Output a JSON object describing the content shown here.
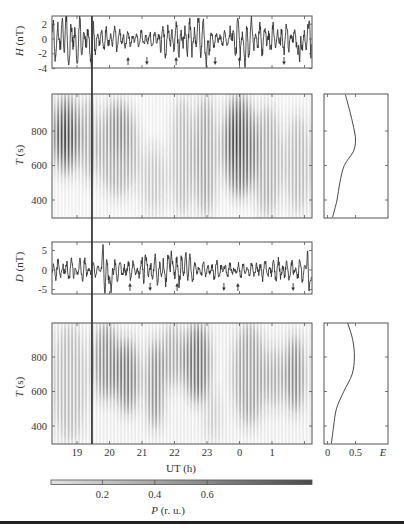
{
  "figure": {
    "marker": {
      "ut": 19.46
    }
  },
  "chart_data": [
    {
      "id": "H-waveform",
      "type": "line",
      "ylabel_var": "H",
      "ylabel_unit": " (nT)",
      "ytick_labels": [
        "2",
        "0",
        "-2",
        "-4"
      ],
      "yticks": [
        2,
        0,
        -2,
        -4
      ],
      "ylim": [
        -4,
        3
      ],
      "xlim": [
        18.23,
        26.2
      ],
      "envelope_nT": [
        [
          18.2,
          18.6,
          2.6
        ],
        [
          18.6,
          19.2,
          3.0
        ],
        [
          19.2,
          19.6,
          2.4
        ],
        [
          19.6,
          20.5,
          1.6
        ],
        [
          20.5,
          21.5,
          1.1
        ],
        [
          21.5,
          22.4,
          2.2
        ],
        [
          22.4,
          23.1,
          2.8
        ],
        [
          23.1,
          23.7,
          1.0
        ],
        [
          23.7,
          24.4,
          2.8
        ],
        [
          24.4,
          25.2,
          2.0
        ],
        [
          25.2,
          26.3,
          2.2
        ]
      ],
      "spikes": [
        [
          18.55,
          3.0
        ],
        [
          18.75,
          -3.5
        ],
        [
          19.0,
          -3.4
        ],
        [
          19.45,
          -4.3
        ],
        [
          22.75,
          3.0
        ],
        [
          22.98,
          -4.0
        ],
        [
          23.95,
          2.8
        ],
        [
          24.17,
          -4.2
        ],
        [
          25.85,
          -3.6
        ],
        [
          26.15,
          2.8
        ]
      ],
      "arrows": [
        {
          "ut": 20.57,
          "dir": "up"
        },
        {
          "ut": 21.15,
          "dir": "down"
        },
        {
          "ut": 22.05,
          "dir": "up"
        },
        {
          "ut": 23.25,
          "dir": "down"
        },
        {
          "ut": 24.0,
          "dir": "up"
        },
        {
          "ut": 25.37,
          "dir": "down"
        }
      ]
    },
    {
      "id": "H-spectrogram",
      "type": "heatmap",
      "ylabel_var": "T",
      "ylabel_unit": " (s)",
      "ytick_labels": [
        "800",
        "600",
        "400"
      ],
      "yticks": [
        800,
        600,
        400
      ],
      "ylim": [
        300,
        1000
      ],
      "xlim": [
        18.23,
        26.2
      ],
      "background_P": 0.06,
      "blobs_ut1_ut2_T1_T2_P": [
        [
          18.25,
          19.1,
          550,
          1010,
          0.6
        ],
        [
          18.35,
          18.9,
          650,
          900,
          0.7
        ],
        [
          19.1,
          19.6,
          500,
          1010,
          0.35
        ],
        [
          19.6,
          20.9,
          420,
          980,
          0.35
        ],
        [
          20.0,
          20.6,
          650,
          950,
          0.3
        ],
        [
          20.9,
          21.8,
          320,
          720,
          0.22
        ],
        [
          21.9,
          22.6,
          300,
          1010,
          0.3
        ],
        [
          22.6,
          23.3,
          300,
          1010,
          0.4
        ],
        [
          23.5,
          24.5,
          420,
          1010,
          0.65
        ],
        [
          23.7,
          24.1,
          600,
          900,
          0.7
        ],
        [
          24.4,
          25.3,
          300,
          950,
          0.35
        ],
        [
          25.4,
          26.2,
          320,
          900,
          0.3
        ]
      ]
    },
    {
      "id": "H-energy",
      "type": "line",
      "xlabel": "E",
      "xticks": [
        0,
        0.5
      ],
      "ylim": [
        300,
        1000
      ],
      "points_T_E": [
        [
          1010,
          0.32
        ],
        [
          900,
          0.41
        ],
        [
          800,
          0.48
        ],
        [
          740,
          0.5
        ],
        [
          680,
          0.46
        ],
        [
          600,
          0.3
        ],
        [
          500,
          0.22
        ],
        [
          400,
          0.17
        ],
        [
          300,
          0.09
        ]
      ]
    },
    {
      "id": "D-waveform",
      "type": "line",
      "ylabel_var": "D",
      "ylabel_unit": " (nT)",
      "ytick_labels": [
        "5",
        "0",
        "-5"
      ],
      "yticks": [
        5,
        0,
        -5
      ],
      "ylim": [
        -6,
        7
      ],
      "xlim": [
        18.23,
        26.2
      ],
      "envelope_nT": [
        [
          18.2,
          19.3,
          2.8
        ],
        [
          19.3,
          19.8,
          1.8
        ],
        [
          19.8,
          20.2,
          3.2
        ],
        [
          20.2,
          21.0,
          2.6
        ],
        [
          21.0,
          22.6,
          3.6
        ],
        [
          22.6,
          23.5,
          2.4
        ],
        [
          23.5,
          24.5,
          1.8
        ],
        [
          24.5,
          25.6,
          2.8
        ],
        [
          25.6,
          26.3,
          2.8
        ]
      ],
      "spikes": [
        [
          19.8,
          6.8
        ],
        [
          19.86,
          -6.5
        ],
        [
          20.05,
          -6.0
        ],
        [
          21.1,
          4.5
        ],
        [
          21.9,
          5.2
        ],
        [
          22.35,
          5.0
        ],
        [
          26.1,
          6.2
        ],
        [
          26.14,
          -6.2
        ]
      ],
      "arrows": [
        {
          "ut": 20.63,
          "dir": "up"
        },
        {
          "ut": 21.25,
          "dir": "down"
        },
        {
          "ut": 22.08,
          "dir": "up"
        },
        {
          "ut": 23.52,
          "dir": "down"
        },
        {
          "ut": 23.95,
          "dir": "up"
        },
        {
          "ut": 25.65,
          "dir": "down"
        }
      ]
    },
    {
      "id": "D-spectrogram",
      "type": "heatmap",
      "ylabel_var": "T",
      "ylabel_unit": " (s)",
      "ytick_labels": [
        "800",
        "600",
        "400"
      ],
      "yticks": [
        800,
        600,
        400
      ],
      "ylim": [
        300,
        1000
      ],
      "xtick_labels": [
        "19",
        "20",
        "21",
        "22",
        "23",
        "0",
        "1"
      ],
      "xlabel": "UT (h)",
      "xlim": [
        18.23,
        26.2
      ],
      "background_P": 0.08,
      "blobs_ut1_ut2_T1_T2_P": [
        [
          18.25,
          19.3,
          300,
          1000,
          0.28
        ],
        [
          19.5,
          20.3,
          550,
          1000,
          0.5
        ],
        [
          20.2,
          20.9,
          480,
          900,
          0.6
        ],
        [
          21.15,
          21.65,
          380,
          900,
          0.55
        ],
        [
          21.6,
          22.3,
          620,
          1000,
          0.35
        ],
        [
          22.3,
          23.1,
          540,
          1000,
          0.65
        ],
        [
          22.95,
          23.4,
          300,
          620,
          0.22
        ],
        [
          23.8,
          24.8,
          400,
          1000,
          0.4
        ],
        [
          24.8,
          25.35,
          500,
          860,
          0.35
        ],
        [
          25.4,
          26.0,
          480,
          920,
          0.55
        ]
      ]
    },
    {
      "id": "D-energy",
      "type": "line",
      "xlabel": "E",
      "xtick_labels": [
        "0",
        "0.5"
      ],
      "xticks": [
        0,
        0.5
      ],
      "ylim": [
        300,
        1000
      ],
      "points_T_E": [
        [
          1000,
          0.36
        ],
        [
          900,
          0.45
        ],
        [
          800,
          0.48
        ],
        [
          700,
          0.44
        ],
        [
          600,
          0.29
        ],
        [
          500,
          0.16
        ],
        [
          400,
          0.11
        ],
        [
          300,
          0.07
        ]
      ]
    },
    {
      "id": "colorbar",
      "type": "colorbar",
      "range": [
        0,
        1
      ],
      "tick_labels": [
        "0.2",
        "0.4",
        "0.6"
      ],
      "ticks": [
        0.2,
        0.4,
        0.6
      ],
      "label_var": "P",
      "label_unit": " (r. u.)",
      "color_low": "#e2e2e2",
      "color_high": "#4a4a4a"
    }
  ]
}
